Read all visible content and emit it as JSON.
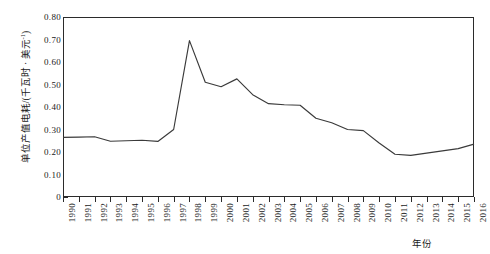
{
  "chart_data": {
    "type": "line",
    "title": "",
    "xlabel": "年份",
    "ylabel": "单位产值电耗/(千瓦时·美元-1)",
    "ylabel_main": "单位产值电耗/(千瓦时 · 美元",
    "ylabel_sup": "-1",
    "ylabel_tail": ")",
    "xlim": [
      1990,
      2016
    ],
    "ylim": [
      0,
      0.8
    ],
    "grid": false,
    "legend": null,
    "ytick_labels": [
      "0.80",
      "0.70",
      "0.60",
      "0.50",
      "0.40",
      "0.30",
      "0.20",
      "0.10",
      "0"
    ],
    "ytick_values": [
      0.8,
      0.7,
      0.6,
      0.5,
      0.4,
      0.3,
      0.2,
      0.1,
      0
    ],
    "categories": [
      "1990",
      "1991",
      "1992",
      "1993",
      "1994",
      "1995",
      "1996",
      "1997",
      "1998",
      "1999",
      "2000",
      "2001",
      "2002",
      "2003",
      "2004",
      "2005",
      "2006",
      "2007",
      "2008",
      "2009",
      "2010",
      "2011",
      "2012",
      "2013",
      "2014",
      "2015",
      "2016"
    ],
    "x": [
      1990,
      1991,
      1992,
      1993,
      1994,
      1995,
      1996,
      1997,
      1998,
      1999,
      2000,
      2001,
      2002,
      2003,
      2004,
      2005,
      2006,
      2007,
      2008,
      2009,
      2010,
      2011,
      2012,
      2013,
      2014,
      2015,
      2016
    ],
    "values": [
      0.265,
      0.266,
      0.268,
      0.248,
      0.25,
      0.252,
      0.247,
      0.3,
      0.695,
      0.51,
      0.49,
      0.525,
      0.455,
      0.415,
      0.41,
      0.408,
      0.35,
      0.33,
      0.3,
      0.295,
      0.24,
      0.19,
      0.185,
      0.195,
      0.205,
      0.215,
      0.235
    ],
    "series": [
      {
        "name": "单位产值电耗",
        "color": "#3a3a3a",
        "values": [
          0.265,
          0.266,
          0.268,
          0.248,
          0.25,
          0.252,
          0.247,
          0.3,
          0.695,
          0.51,
          0.49,
          0.525,
          0.455,
          0.415,
          0.41,
          0.408,
          0.35,
          0.33,
          0.3,
          0.295,
          0.24,
          0.19,
          0.185,
          0.195,
          0.205,
          0.215,
          0.235
        ]
      }
    ]
  },
  "colors": {
    "line": "#3a3a3a",
    "axis": "#2b2b2b",
    "background": "#ffffff",
    "text": "#1a1a1a"
  }
}
